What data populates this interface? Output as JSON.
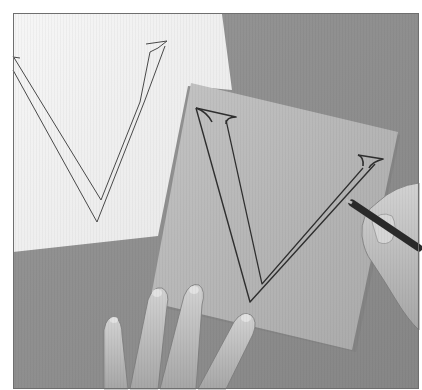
{
  "image": {
    "description": "Grayscale photograph: a hand traces the outline of a serif letter V onto a sheet of tracing paper laid over a table, beside a white sheet with a printed V outline; another hand holds a pencil.",
    "subject_letter": "V",
    "colors": {
      "background": "#ffffff",
      "frame_line": "#6f6f6f",
      "table": "#8d8d8d",
      "white_paper": "#f1f1f1",
      "tracing_paper": "#b4b4b4",
      "skin": "#c9c9c9",
      "skin_shadow": "#9a9a9a",
      "pencil": "#2b2b2b",
      "stroke": "#3a3a3a"
    }
  }
}
